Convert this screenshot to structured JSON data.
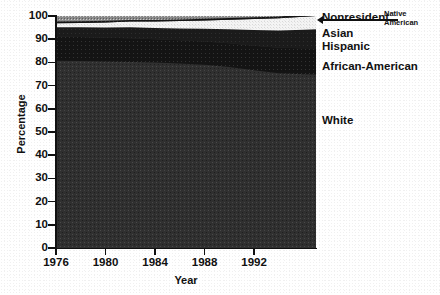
{
  "title": "College Enrollment by Race",
  "axes": {
    "ylabel": "Percentage",
    "xlabel": "Year",
    "yticks": [
      "0",
      "10",
      "20",
      "30",
      "40",
      "50",
      "60",
      "70",
      "80",
      "90",
      "100"
    ],
    "xticks": [
      "1976",
      "1980",
      "1984",
      "1988",
      "1992"
    ]
  },
  "labels": {
    "nonresident": "Nonresident",
    "native_american": "Native American",
    "asian": "Asian",
    "hispanic": "Hispanic",
    "african_american": "African-American",
    "white": "White"
  },
  "chart_data": {
    "type": "area",
    "title": "College Enrollment by Race",
    "xlabel": "Year",
    "ylabel": "Percentage",
    "xlim": [
      1976,
      1997
    ],
    "ylim": [
      0,
      100
    ],
    "grid": false,
    "legend_position": "right-inline-labels",
    "stacked": true,
    "x": [
      1976,
      1978,
      1980,
      1982,
      1984,
      1986,
      1988,
      1990,
      1992,
      1994,
      1996,
      1997
    ],
    "series": [
      {
        "name": "White",
        "color": "#2f2f2f",
        "values": [
          80.7,
          80.6,
          80.4,
          80.2,
          80.0,
          79.5,
          79.0,
          78.0,
          76.6,
          75.3,
          74.9,
          74.8
        ]
      },
      {
        "name": "African-American",
        "color": "#0d0d0d",
        "values": [
          10.5,
          10.3,
          10.2,
          10.2,
          10.0,
          10.0,
          10.0,
          10.3,
          10.6,
          11.0,
          11.2,
          11.3
        ]
      },
      {
        "name": "Hispanic",
        "color": "#1c1c1c",
        "values": [
          4.0,
          4.2,
          4.4,
          4.7,
          4.8,
          5.1,
          5.5,
          6.0,
          6.8,
          7.5,
          8.0,
          8.2
        ]
      },
      {
        "name": "Asian",
        "color": "#f2f2f2",
        "values": [
          1.7,
          1.9,
          2.2,
          2.5,
          2.8,
          3.2,
          3.6,
          4.1,
          4.7,
          5.2,
          5.6,
          5.7
        ]
      },
      {
        "name": "Native American",
        "color": "#141414",
        "values": [
          0.7,
          0.7,
          0.7,
          0.7,
          0.7,
          0.7,
          0.7,
          0.7,
          0.8,
          0.8,
          0.9,
          0.9
        ]
      },
      {
        "name": "Nonresident",
        "color": "#8c8c8c",
        "values": [
          2.4,
          2.3,
          2.1,
          1.7,
          1.7,
          1.5,
          1.2,
          0.9,
          0.5,
          0.2,
          0.4,
          0.1
        ]
      }
    ]
  }
}
